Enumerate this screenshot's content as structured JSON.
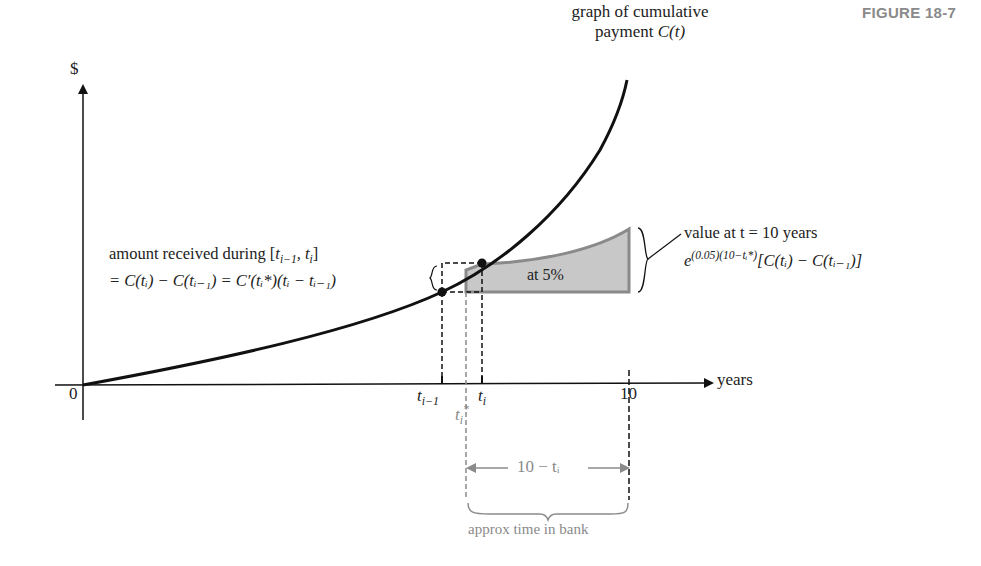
{
  "figure_label": "FIGURE 18-7",
  "axes": {
    "y_label": "$",
    "x_label": "years",
    "origin_label": "0",
    "ticks": {
      "t_prev": "t",
      "t_prev_sub": "i−1",
      "t_star": "t",
      "t_star_sub": "i",
      "t_star_sup": "*",
      "t_i": "t",
      "t_i_sub": "i",
      "ten": "10"
    }
  },
  "curve_label": {
    "line1": "graph of cumulative",
    "line2_text": "payment ",
    "line2_math": "C(t)"
  },
  "amount_label": {
    "line1_text": "amount received during [",
    "line1_math": "t",
    "line1_sub": "i−1",
    "line1_rest": ", t",
    "line1_sub2": "i",
    "line1_close": "]",
    "line2": "= C(tᵢ) − C(tᵢ₋₁) = C′(tᵢ*)(tᵢ − tᵢ₋₁)"
  },
  "shaded_label": "at 5%",
  "value_label": {
    "line1": "value at t = 10 years",
    "line2_base": "e",
    "line2_exp": "(0.05)(10−tᵢ*)",
    "line2_rest": "[C(tᵢ) − C(tᵢ₋₁)]"
  },
  "interval_label": "10 − tᵢ",
  "bracket_label": "approx time in bank",
  "colors": {
    "curve": "#111111",
    "shade_fill": "#c8c8c8",
    "shade_edge": "#8a8a8a",
    "gray_annot": "#8a8a8a"
  }
}
